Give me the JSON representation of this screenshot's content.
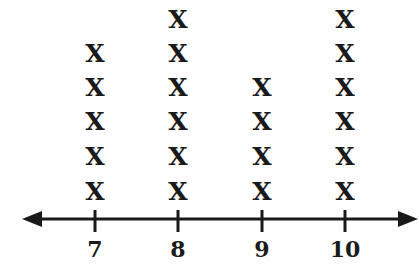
{
  "chart_data": {
    "type": "line plot (dot plot with X marks)",
    "title": "",
    "xlabel": "",
    "ylabel": "",
    "categories": [
      "7",
      "8",
      "9",
      "10"
    ],
    "values": [
      5,
      6,
      4,
      6
    ],
    "marker": "X",
    "axis": {
      "arrows": "both ends",
      "ticks": [
        "7",
        "8",
        "9",
        "10"
      ]
    },
    "grid": false,
    "legend": null
  },
  "layout": {
    "axis_color": "#1a1a1a",
    "tick_x": [
      95,
      178,
      262,
      345
    ],
    "axis_y": 219,
    "row_y": [
      192,
      157,
      122,
      88,
      54,
      20
    ]
  }
}
